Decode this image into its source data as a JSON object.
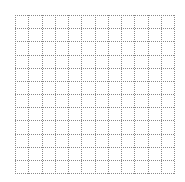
{
  "grid": {
    "rows": 12,
    "cols": 12,
    "line_style": "dotted",
    "line_color": "#8a8a8a",
    "background": "#ffffff"
  }
}
